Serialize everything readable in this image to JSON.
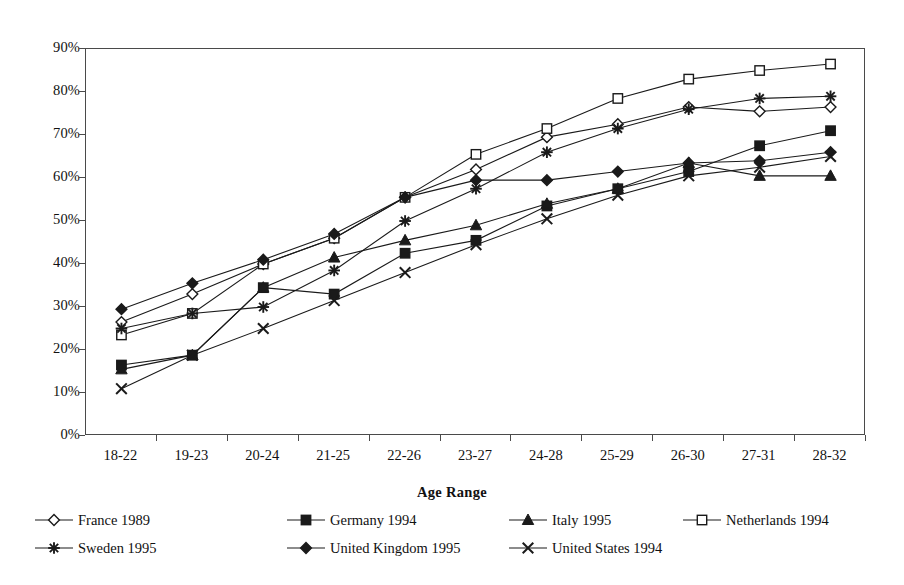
{
  "chart_data": {
    "type": "line",
    "title": "",
    "xlabel": "Age Range",
    "ylabel": "",
    "categories": [
      "18-22",
      "19-23",
      "20-24",
      "21-25",
      "22-26",
      "23-27",
      "24-28",
      "25-29",
      "26-30",
      "27-31",
      "28-32"
    ],
    "ylim": [
      0,
      90
    ],
    "ytick_labels": [
      "0%",
      "10%",
      "20%",
      "30%",
      "40%",
      "50%",
      "60%",
      "70%",
      "80%",
      "90%"
    ],
    "yticks": [
      0,
      10,
      20,
      30,
      40,
      50,
      60,
      70,
      80,
      90
    ],
    "grid": false,
    "legend_position": "bottom",
    "series": [
      {
        "name": "France 1989",
        "marker": "open-diamond",
        "values": [
          26.5,
          33.0,
          40.0,
          46.0,
          55.5,
          62.0,
          69.5,
          72.5,
          76.5,
          75.5,
          76.5
        ]
      },
      {
        "name": "Germany 1994",
        "marker": "filled-square",
        "values": [
          16.5,
          18.8,
          34.5,
          33.0,
          42.5,
          45.5,
          53.5,
          57.5,
          61.5,
          67.5,
          71.0
        ]
      },
      {
        "name": "Italy 1995",
        "marker": "filled-triangle",
        "values": [
          15.5,
          18.8,
          34.5,
          41.5,
          45.5,
          49.0,
          54.0,
          57.5,
          63.5,
          60.5,
          60.5
        ]
      },
      {
        "name": "Netherlands 1994",
        "marker": "open-square",
        "values": [
          23.5,
          28.5,
          40.0,
          46.0,
          55.5,
          65.5,
          71.5,
          78.5,
          83.0,
          85.0,
          86.5
        ]
      },
      {
        "name": "Sweden 1995",
        "marker": "asterisk",
        "values": [
          25.0,
          28.5,
          30.0,
          38.5,
          50.0,
          57.5,
          66.0,
          71.5,
          76.0,
          78.5,
          79.0
        ]
      },
      {
        "name": "United Kingdom 1995",
        "marker": "filled-diamond",
        "values": [
          29.5,
          35.5,
          41.0,
          47.0,
          55.5,
          59.5,
          59.5,
          61.5,
          63.5,
          64.0,
          66.0
        ]
      },
      {
        "name": "United States 1994",
        "marker": "cross-x",
        "values": [
          11.0,
          18.8,
          25.0,
          31.5,
          38.0,
          44.5,
          50.5,
          56.0,
          60.5,
          62.5,
          65.0
        ]
      }
    ]
  },
  "axis": {
    "x_title": "Age Range"
  },
  "legend": {
    "items": [
      {
        "label": "France 1989",
        "marker": "open-diamond"
      },
      {
        "label": "Germany 1994",
        "marker": "filled-square"
      },
      {
        "label": "Italy 1995",
        "marker": "filled-triangle"
      },
      {
        "label": "Netherlands 1994",
        "marker": "open-square"
      },
      {
        "label": "Sweden 1995",
        "marker": "asterisk"
      },
      {
        "label": "United Kingdom 1995",
        "marker": "filled-diamond"
      },
      {
        "label": "United States 1994",
        "marker": "cross-x"
      }
    ]
  },
  "style": {
    "line_color": "#1a1a1a",
    "axis_color": "#4a4a4a",
    "background": "#ffffff"
  }
}
